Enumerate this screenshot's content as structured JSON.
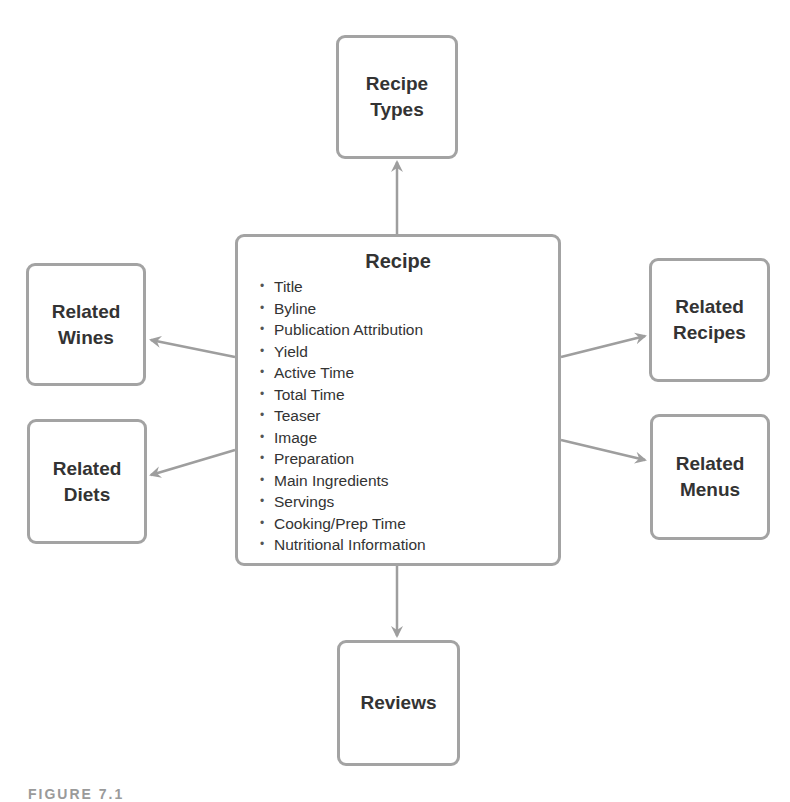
{
  "diagram": {
    "center": {
      "title": "Recipe",
      "bullet": "•",
      "fields": [
        "Title",
        "Byline",
        "Publication Attribution",
        "Yield",
        "Active Time",
        "Total Time",
        "Teaser",
        "Image",
        "Preparation",
        "Main Ingredients",
        "Servings",
        "Cooking/Prep Time",
        "Nutritional Information"
      ]
    },
    "nodes": {
      "recipe_types": "Recipe\nTypes",
      "related_wines": "Related\nWines",
      "related_diets": "Related\nDiets",
      "related_recipes": "Related\nRecipes",
      "related_menus": "Related\nMenus",
      "reviews": "Reviews"
    },
    "edges": [
      {
        "from": "Recipe",
        "to": "Recipe Types"
      },
      {
        "from": "Recipe",
        "to": "Related Wines"
      },
      {
        "from": "Recipe",
        "to": "Related Diets"
      },
      {
        "from": "Recipe",
        "to": "Related Recipes"
      },
      {
        "from": "Recipe",
        "to": "Related Menus"
      },
      {
        "from": "Recipe",
        "to": "Reviews"
      }
    ],
    "colors": {
      "border": "#a3a3a3",
      "text": "#333333",
      "arrow": "#9e9e9e"
    },
    "caption": "FIGURE 7.1"
  }
}
